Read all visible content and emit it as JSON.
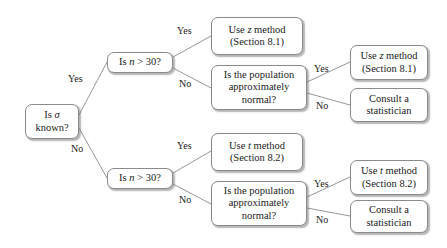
{
  "diagram": {
    "line_color": "#8a8a8a",
    "text_color": "#1a1a1a",
    "background": "#ffffff"
  },
  "nodes": {
    "root": {
      "line1_a": "Is ",
      "line1_b": "σ",
      "line2": "known?"
    },
    "n30_top": {
      "pre": "Is ",
      "var": "n",
      "post": " > 30?"
    },
    "n30_bottom": {
      "pre": "Is ",
      "var": "n",
      "post": " > 30?"
    },
    "z_method_top": {
      "line1_a": "Use ",
      "line1_b": "z",
      "line1_c": " method",
      "line2": "(Section 8.1)"
    },
    "pop_normal_top": {
      "line1": "Is the population",
      "line2": "approximately",
      "line3": "normal?"
    },
    "z_method_right": {
      "line1_a": "Use ",
      "line1_b": "z",
      "line1_c": " method",
      "line2": "(Section 8.1)"
    },
    "consult_top": {
      "line1": "Consult a",
      "line2": "statistician"
    },
    "t_method_top": {
      "line1_a": "Use ",
      "line1_b": "t",
      "line1_c": " method",
      "line2": "(Section 8.2)"
    },
    "pop_normal_bottom": {
      "line1": "Is the population",
      "line2": "approximately",
      "line3": "normal?"
    },
    "t_method_right": {
      "line1_a": "Use ",
      "line1_b": "t",
      "line1_c": " method",
      "line2": "(Section 8.2)"
    },
    "consult_bottom": {
      "line1": "Consult a",
      "line2": "statistician"
    }
  },
  "edge_labels": {
    "root_yes": "Yes",
    "root_no": "No",
    "n30_top_yes": "Yes",
    "n30_top_no": "No",
    "pop_top_yes": "Yes",
    "pop_top_no": "No",
    "n30_bottom_yes": "Yes",
    "n30_bottom_no": "No",
    "pop_bottom_yes": "Yes",
    "pop_bottom_no": "No"
  }
}
